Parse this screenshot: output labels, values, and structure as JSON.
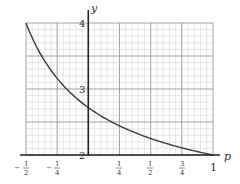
{
  "chart_data": {
    "type": "line",
    "title": "",
    "xlabel": "p",
    "ylabel": "y",
    "xlim": [
      -0.5,
      1
    ],
    "ylim": [
      2,
      4
    ],
    "grid": true,
    "x_ticks": [
      {
        "value": -0.5,
        "num": "1",
        "den": "2",
        "sign": "−"
      },
      {
        "value": -0.25,
        "num": "1",
        "den": "4",
        "sign": "−"
      },
      {
        "value": 0.25,
        "num": "1",
        "den": "4",
        "sign": ""
      },
      {
        "value": 0.5,
        "num": "1",
        "den": "2",
        "sign": ""
      },
      {
        "value": 0.75,
        "num": "3",
        "den": "4",
        "sign": ""
      },
      {
        "value": 1,
        "label": "1"
      }
    ],
    "y_ticks": [
      {
        "value": 2,
        "label": "2"
      },
      {
        "value": 3,
        "label": "3"
      },
      {
        "value": 4,
        "label": "4"
      }
    ],
    "series": [
      {
        "name": "y = (1+p)^(1/p)",
        "x": [
          -0.5,
          -0.4,
          -0.3,
          -0.2,
          -0.1,
          0,
          0.1,
          0.2,
          0.3,
          0.4,
          0.5,
          0.6,
          0.7,
          0.8,
          0.9,
          1
        ],
        "y": [
          4.0,
          3.586,
          3.284,
          3.052,
          2.868,
          2.718,
          2.594,
          2.488,
          2.398,
          2.319,
          2.25,
          2.191,
          2.135,
          2.085,
          2.041,
          2.0
        ]
      }
    ]
  },
  "labels": {
    "x_axis": "p",
    "y_axis": "y",
    "y4": "4",
    "y3": "3",
    "y2": "2",
    "x1": "1",
    "neg_half_num": "1",
    "neg_half_den": "2",
    "neg_quarter_num": "1",
    "neg_quarter_den": "4",
    "quarter_num": "1",
    "quarter_den": "4",
    "half_num": "1",
    "half_den": "2",
    "three_quarter_num": "3",
    "three_quarter_den": "4",
    "minus": "−"
  }
}
